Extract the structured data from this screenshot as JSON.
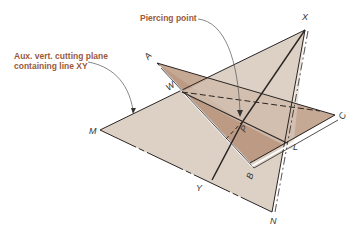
{
  "diagram": {
    "callouts": {
      "cutting_plane": {
        "line1": "Aux. vert. cutting plane",
        "line2": "containing line XY"
      },
      "piercing_point": "Piercing point"
    },
    "point_labels": {
      "X": "X",
      "A": "A",
      "W": "W",
      "M": "M",
      "P": "P",
      "C": "C",
      "L": "L",
      "B": "B",
      "Y": "Y",
      "N": "N"
    },
    "colors": {
      "vertical_plane": "#ddd1c6",
      "oblique_plane": "#bfa08d",
      "oblique_overlap": "#b8957f",
      "callout_text": "#9a5a3c",
      "line": "#2a2523"
    }
  }
}
